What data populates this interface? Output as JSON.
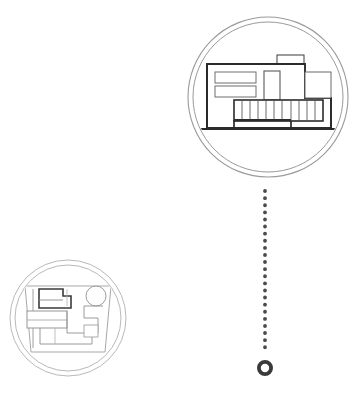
{
  "document": {
    "type": "architectural-illustration",
    "background_color": "#ffffff",
    "width": 360,
    "height": 410
  },
  "palette": {
    "ink_dark": "#2e2e2e",
    "ink_medium": "#555555",
    "ink_light": "#9a9a9a",
    "ink_faint": "#b9b9b9",
    "background": "#ffffff"
  },
  "nodes": {
    "elevation_medallion": {
      "name": "building-elevation-medallion",
      "center_x": 268,
      "center_y": 97,
      "outer_radius": 80,
      "inner_radius": 75,
      "ring_color": "#9a9a9a",
      "ring_width": 1,
      "contents_label": "modernist-house-elevation",
      "drawing": {
        "facade": {
          "x": 207,
          "y": 64,
          "width": 98,
          "height": 62
        },
        "roof_box": {
          "x": 277,
          "y": 55,
          "width": 26,
          "height": 10
        },
        "upper_right_block": {
          "x": 303,
          "y": 72,
          "width": 28,
          "height": 26
        },
        "window_band_top": {
          "x": 215,
          "y": 72,
          "width": 40,
          "height": 11
        },
        "window_band_bottom": {
          "x": 215,
          "y": 86,
          "width": 40,
          "height": 11
        },
        "tall_window": {
          "x": 264,
          "y": 71,
          "width": 16,
          "height": 28
        },
        "balcony": {
          "x": 234,
          "y": 100,
          "width": 89,
          "height": 20
        },
        "balcony_slat_count": 11,
        "ground_line": {
          "x1": 199,
          "y1": 129,
          "x2": 337,
          "y2": 129
        },
        "pilotis_left": {
          "x": 207,
          "y": 126
        },
        "terrace_step": {
          "x": 234,
          "y": 120,
          "width": 57,
          "height": 9
        }
      }
    },
    "plan_medallion": {
      "name": "floor-plan-medallion",
      "center_x": 68,
      "center_y": 318,
      "outer_radius": 58,
      "inner_radius": 53,
      "ring_color": "#b9b9b9",
      "ring_width": 1,
      "contents_label": "site-floor-plan",
      "drawing": {
        "plot_outline": [
          [
            26,
            287
          ],
          [
            110,
            287
          ],
          [
            104,
            351
          ],
          [
            32,
            351
          ]
        ],
        "highlight_room": {
          "x": 39,
          "y": 289,
          "width": 32,
          "height": 18
        },
        "room_band_mid": {
          "x": 28,
          "y": 311,
          "width": 38,
          "height": 16
        },
        "circle_feature": {
          "cx": 96,
          "cy": 296,
          "r": 10
        },
        "interior_walls": 6
      }
    }
  },
  "connector": {
    "name": "dotted-connector-line",
    "orientation": "vertical",
    "x": 265,
    "y_start": 191,
    "y_end": 352,
    "dot_radius": 1.9,
    "dot_spacing": 7,
    "color": "#4a4a4a"
  },
  "end_marker": {
    "name": "connector-end-ring",
    "cx": 265,
    "cy": 368,
    "outer_radius": 8,
    "inner_radius": 4.2,
    "color": "#3a3a3a"
  }
}
